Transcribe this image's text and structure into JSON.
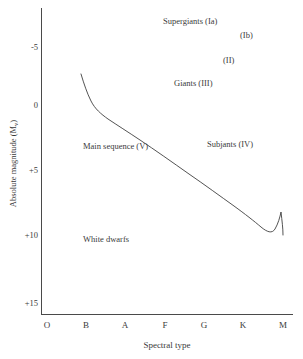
{
  "chart_data": {
    "type": "line",
    "title": "",
    "xlabel": "Spectral type",
    "ylabel": "Absolute magnitude (M",
    "ylabel_sub": "v",
    "ylabel_suffix": ")",
    "grid": false,
    "legend": "none",
    "x_categories": [
      "O",
      "B",
      "A",
      "F",
      "G",
      "K",
      "M"
    ],
    "y_ticks": [
      "-5",
      "0",
      "+5",
      "+10",
      "+15"
    ],
    "ylim": [
      -7.5,
      17
    ],
    "y_axis_inverted": true,
    "series": [
      {
        "name": "Main sequence (V)",
        "comment": "Absolute magnitude versus spectral type along the main sequence band",
        "x": [
          "B0",
          "B3",
          "B7",
          "A0",
          "A5",
          "F0",
          "F5",
          "G0",
          "G5",
          "K0",
          "K5",
          "M0",
          "M3",
          "M5"
        ],
        "points": [
          {
            "spectral": "B0",
            "magnitude": -3.4
          },
          {
            "spectral": "B5",
            "magnitude": -1.0
          },
          {
            "spectral": "A0",
            "magnitude": 0.3
          },
          {
            "spectral": "A5",
            "magnitude": 1.2
          },
          {
            "spectral": "F0",
            "magnitude": 2.2
          },
          {
            "spectral": "F5",
            "magnitude": 3.0
          },
          {
            "spectral": "G0",
            "magnitude": 3.9
          },
          {
            "spectral": "G5",
            "magnitude": 4.6
          },
          {
            "spectral": "K0",
            "magnitude": 5.4
          },
          {
            "spectral": "K5",
            "magnitude": 6.6
          },
          {
            "spectral": "M0",
            "magnitude": 7.5
          },
          {
            "spectral": "M3",
            "magnitude": 9.0
          },
          {
            "spectral": "M5",
            "magnitude": 10.0
          }
        ]
      }
    ],
    "annotations": [
      {
        "label": "Supergiants (Ia)",
        "spectral": "F0",
        "magnitude": -7.0
      },
      {
        "label": "(Ib)",
        "spectral": "K2",
        "magnitude": -6.1
      },
      {
        "label": "(II)",
        "spectral": "G6",
        "magnitude": -4.0
      },
      {
        "label": "Giants (III)",
        "spectral": "G0",
        "magnitude": -2.2
      },
      {
        "label": "Subjants (IV)",
        "spectral": "K0",
        "magnitude": 2.8
      },
      {
        "label": "Main sequence (V)",
        "spectral": "A3",
        "magnitude": 2.9
      },
      {
        "label": "White dwarfs",
        "spectral": "B8",
        "magnitude": 11.2
      }
    ]
  },
  "axes": {
    "y_title_main": "Absolute magnitude (M",
    "y_title_sub": "v",
    "y_title_close": ")",
    "x_title": "Spectral type",
    "y_ticks": [
      {
        "label": "-5",
        "top": 43
      },
      {
        "label": "0",
        "top": 101
      },
      {
        "label": "+5",
        "top": 166
      },
      {
        "label": "+10",
        "top": 231
      },
      {
        "label": "+15",
        "top": 299
      }
    ],
    "x_ticks": [
      {
        "label": "O",
        "left": 47
      },
      {
        "label": "B",
        "left": 86
      },
      {
        "label": "A",
        "left": 125
      },
      {
        "label": "F",
        "left": 165
      },
      {
        "label": "G",
        "left": 204
      },
      {
        "label": "K",
        "left": 243
      },
      {
        "label": "M",
        "left": 283
      }
    ]
  },
  "regions": [
    {
      "name": "supergiants-ia",
      "label": "Supergiants (Ia)",
      "left": 163,
      "top": 16
    },
    {
      "name": "supergiants-ib",
      "label": "(Ib)",
      "left": 240,
      "top": 30
    },
    {
      "name": "bright-giants-ii",
      "label": "(II)",
      "left": 223,
      "top": 55
    },
    {
      "name": "giants-iii",
      "label": "Giants (III)",
      "left": 174,
      "top": 78
    },
    {
      "name": "subgiants-iv",
      "label": "Subjants (IV)",
      "left": 207,
      "top": 139
    },
    {
      "name": "main-sequence-v",
      "label": "Main sequence (V)",
      "left": 83,
      "top": 141
    },
    {
      "name": "white-dwarfs",
      "label": "White dwarfs",
      "left": 83,
      "top": 234
    }
  ],
  "curve": {
    "name": "main-sequence-curve",
    "stroke": "#3f3f3f",
    "stroke_width": 0.9,
    "path": "M 81,74 C 84,84 87,93 91,101 C 95,109 101,114 108,119 C 117,125 128,132 140,140 C 155,150 172,162 189,174 C 205,185 220,196 234,206 C 245,214 254,221 261,227 C 267,232 272,234 275,229 C 278,224 280,217 281,212 C 282,221 283,228 283,235"
  },
  "colors": {
    "axis": "#4a4a4a",
    "text": "#3a3a3a",
    "curve": "#3f3f3f",
    "background": "#ffffff"
  }
}
